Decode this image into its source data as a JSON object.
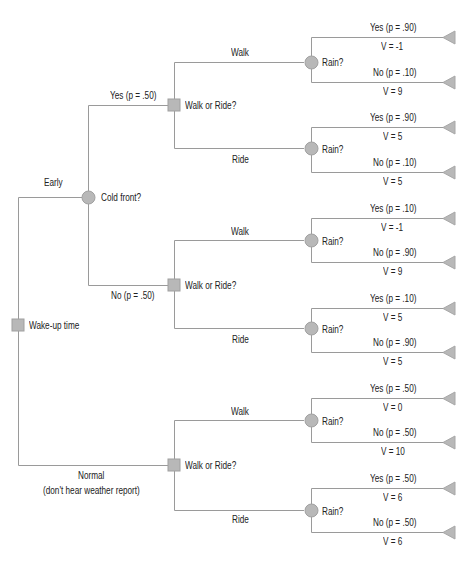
{
  "diagram": {
    "type": "decision-tree",
    "colors": {
      "line": "#9a9a9a",
      "node_fill": "#b8b8b8",
      "node_stroke": "#a0a0a0",
      "text": "#222222"
    },
    "root": {
      "label": "Wake-up time",
      "shape": "square"
    },
    "early": {
      "branch_label": "Early",
      "node_label": "Cold front?",
      "yes": {
        "branch_label": "Yes (p = .50)",
        "node_label": "Walk or Ride?",
        "walk": {
          "branch_label": "Walk",
          "node_label": "Rain?",
          "yes": {
            "label": "Yes (p = .90)",
            "value": "V = -1"
          },
          "no": {
            "label": "No (p = .10)",
            "value": "V = 9"
          }
        },
        "ride": {
          "branch_label": "Ride",
          "node_label": "Rain?",
          "yes": {
            "label": "Yes (p = .90)",
            "value": "V = 5"
          },
          "no": {
            "label": "No (p = .10)",
            "value": "V = 5"
          }
        }
      },
      "no": {
        "branch_label": "No (p = .50)",
        "node_label": "Walk or Ride?",
        "walk": {
          "branch_label": "Walk",
          "node_label": "Rain?",
          "yes": {
            "label": "Yes (p = .10)",
            "value": "V = -1"
          },
          "no": {
            "label": "No (p = .90)",
            "value": "V = 9"
          }
        },
        "ride": {
          "branch_label": "Ride",
          "node_label": "Rain?",
          "yes": {
            "label": "Yes (p = .10)",
            "value": "V = 5"
          },
          "no": {
            "label": "No (p = .90)",
            "value": "V = 5"
          }
        }
      }
    },
    "normal": {
      "branch_label_line1": "Normal",
      "branch_label_line2": "(don't hear weather report)",
      "node_label": "Walk or Ride?",
      "walk": {
        "branch_label": "Walk",
        "node_label": "Rain?",
        "yes": {
          "label": "Yes (p = .50)",
          "value": "V = 0"
        },
        "no": {
          "label": "No (p = .50)",
          "value": "V = 10"
        }
      },
      "ride": {
        "branch_label": "Ride",
        "node_label": "Rain?",
        "yes": {
          "label": "Yes (p = .50)",
          "value": "V = 6"
        },
        "no": {
          "label": "No (p = .50)",
          "value": "V = 6"
        }
      }
    }
  }
}
